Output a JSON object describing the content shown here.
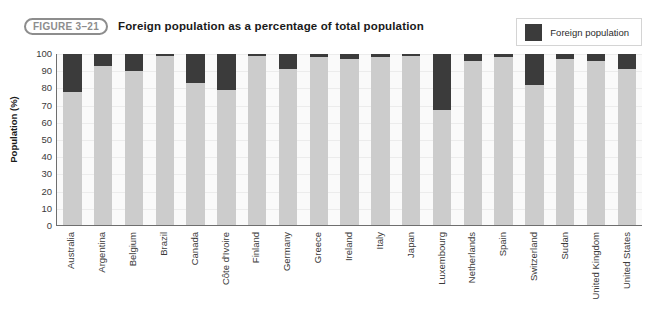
{
  "header": {
    "figure_badge": "FIGURE 3–21",
    "title": "Foreign population as a percentage of total population"
  },
  "legend": {
    "position": "top-right",
    "entries": [
      {
        "label": "Foreign population",
        "color": "#3b3b3b"
      }
    ]
  },
  "colors": {
    "foreign": "#3b3b3b",
    "native": "#cccccc",
    "plot_background": "#fafafa",
    "axis": "#6e6e6e",
    "gridline": "#ececec",
    "badge_border": "#8d8d8d"
  },
  "chart_data": {
    "type": "bar",
    "subtype": "stacked-100-percent",
    "title": "Foreign population as a percentage of total population",
    "subtitle": "",
    "xlabel": "",
    "ylabel": "Population (%)",
    "ylim": [
      0,
      100
    ],
    "ytick_labels": [
      "100",
      "90",
      "80",
      "70",
      "60",
      "50",
      "40",
      "30",
      "20",
      "10",
      "0"
    ],
    "ytick_values": [
      100,
      90,
      80,
      70,
      60,
      50,
      40,
      30,
      20,
      10,
      0
    ],
    "grid": true,
    "legend_position": "top-right",
    "annotations": [],
    "categories": [
      "Australia",
      "Argentina",
      "Belgium",
      "Brazil",
      "Canada",
      "Côte d'Ivoire",
      "Finland",
      "Germany",
      "Greece",
      "Ireland",
      "Italy",
      "Japan",
      "Luxembourg",
      "Netherlands",
      "Spain",
      "Switzerland",
      "Sudan",
      "United Kingdom",
      "United States"
    ],
    "series": [
      {
        "name": "Foreign population",
        "color": "#3b3b3b",
        "values": [
          22,
          7,
          10,
          1,
          17,
          21,
          1,
          9,
          2,
          3,
          2,
          1,
          33,
          4,
          2,
          18,
          3,
          4,
          9
        ]
      },
      {
        "name": "Native population",
        "color": "#cccccc",
        "values": [
          78,
          93,
          90,
          99,
          83,
          79,
          99,
          91,
          98,
          97,
          98,
          99,
          67,
          96,
          98,
          82,
          97,
          96,
          91
        ]
      }
    ]
  }
}
